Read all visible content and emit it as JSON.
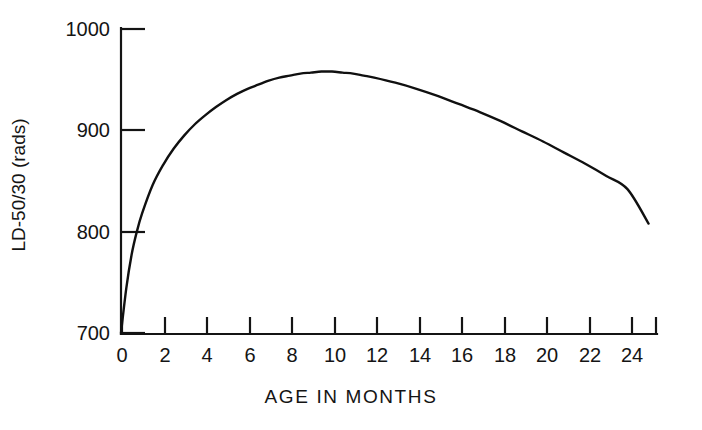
{
  "figure": {
    "background_color": "#ffffff",
    "line_color": "#101010",
    "axis_color": "#141414"
  },
  "chart_data": {
    "type": "line",
    "title": "",
    "subtitle": "",
    "xlabel": "AGE IN MONTHS",
    "ylabel": "LD-50/30 (rads)",
    "xlim": [
      0,
      25.4
    ],
    "ylim": [
      700,
      1000
    ],
    "xticks": [
      0,
      2,
      4,
      6,
      8,
      10,
      12,
      14,
      16,
      18,
      20,
      22,
      24
    ],
    "xtick_labels": [
      "0",
      "2",
      "4",
      "6",
      "8",
      "10",
      "12",
      "14",
      "16",
      "18",
      "20",
      "22",
      "24"
    ],
    "yticks": [
      700,
      800,
      900,
      1000
    ],
    "ytick_labels": [
      "700",
      "800",
      "900",
      "1000"
    ],
    "grid": false,
    "legend": null,
    "legend_position": "none",
    "annotations": [],
    "series": [
      {
        "name": "LD-50/30",
        "x": [
          0.0,
          0.25,
          0.5,
          0.75,
          1.0,
          1.5,
          2.0,
          2.5,
          3.0,
          3.5,
          4.0,
          4.5,
          5.0,
          5.5,
          6.0,
          6.5,
          7.0,
          7.5,
          8.0,
          8.5,
          9.0,
          9.5,
          10.0,
          10.5,
          11.0,
          11.5,
          12.0,
          13.0,
          14.0,
          15.0,
          16.0,
          17.0,
          18.0,
          19.0,
          20.0,
          21.0,
          22.0,
          23.0,
          24.0,
          25.0
        ],
        "y": [
          700,
          744,
          777,
          800,
          818,
          846,
          866,
          882,
          895,
          906,
          915,
          923,
          930,
          936,
          941,
          945,
          949,
          952,
          954,
          956,
          957,
          958,
          958,
          957,
          956,
          954,
          952,
          947,
          941,
          934,
          926,
          918,
          909,
          899,
          889,
          878,
          867,
          855,
          842,
          808
        ]
      }
    ]
  }
}
